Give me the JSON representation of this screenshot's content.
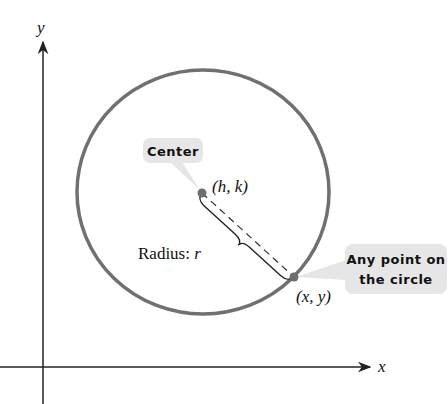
{
  "diagram": {
    "axes": {
      "x_label": "x",
      "y_label": "y"
    },
    "center_label": "(h, k)",
    "point_label": "(x, y)",
    "radius_label_prefix": "Radius: ",
    "radius_label_var": "r",
    "callouts": {
      "center": "Center",
      "point_line1": "Any point on",
      "point_line2": "the circle"
    },
    "colors": {
      "circle": "#707070",
      "axes": "#222222",
      "callout_bg": "#e6e6e6",
      "dot": "#6e6e6e"
    }
  }
}
